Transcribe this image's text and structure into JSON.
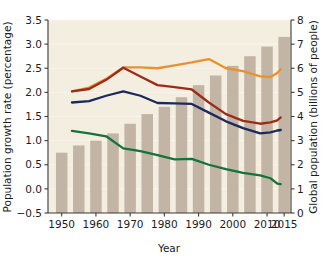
{
  "chart_data": {
    "type": "bar",
    "title": "",
    "xlabel": "Year",
    "ylabel": "Population growth rate (percentage)",
    "y2label": "Global population (billions of people)",
    "xlim": [
      1946,
      2017
    ],
    "ylim": [
      -0.5,
      3.5
    ],
    "y2lim": [
      0,
      8
    ],
    "grid": true,
    "legend": "none",
    "background_color": "#f4eee1",
    "bar_color": "#c3b5a5",
    "xticks": [
      1950,
      1960,
      1970,
      1980,
      1990,
      2000,
      2010,
      2015
    ],
    "yticks": [
      -0.5,
      0.0,
      0.5,
      1.0,
      1.5,
      2.0,
      2.5,
      3.0,
      3.5
    ],
    "ytick_labels": [
      "−0.5",
      "0.0",
      "0.5",
      "1.0",
      "1.5",
      "2.0",
      "2.5",
      "3.0",
      "3.5"
    ],
    "y2ticks": [
      0,
      1,
      2,
      3,
      4,
      5,
      6,
      7,
      8
    ],
    "bars": {
      "name": "Global population",
      "axis": "right",
      "units": "billions of people",
      "x": [
        1950,
        1955,
        1960,
        1965,
        1970,
        1975,
        1980,
        1985,
        1990,
        1995,
        2000,
        2005,
        2010,
        2015
      ],
      "values": [
        2.5,
        2.8,
        3.0,
        3.3,
        3.7,
        4.1,
        4.4,
        4.8,
        5.3,
        5.7,
        6.1,
        6.5,
        6.9,
        7.3
      ]
    },
    "series": [
      {
        "name": "Orange line",
        "color": "#e8912f",
        "axis": "left",
        "x": [
          1953,
          1958,
          1963,
          1968,
          1973,
          1978,
          1983,
          1988,
          1993,
          1998,
          2003,
          2008,
          2011,
          2013,
          2014
        ],
        "values": [
          2.02,
          2.1,
          2.28,
          2.52,
          2.52,
          2.5,
          2.56,
          2.62,
          2.69,
          2.5,
          2.44,
          2.33,
          2.32,
          2.4,
          2.48
        ]
      },
      {
        "name": "Dark red line",
        "color": "#9e2b17",
        "axis": "left",
        "x": [
          1953,
          1958,
          1963,
          1968,
          1973,
          1978,
          1983,
          1988,
          1993,
          1998,
          2003,
          2008,
          2011,
          2013,
          2014
        ],
        "values": [
          2.02,
          2.07,
          2.26,
          2.51,
          2.33,
          2.15,
          2.11,
          2.06,
          1.79,
          1.55,
          1.41,
          1.35,
          1.38,
          1.42,
          1.48
        ]
      },
      {
        "name": "Navy line",
        "color": "#1b2a5e",
        "axis": "left",
        "x": [
          1953,
          1958,
          1963,
          1968,
          1973,
          1978,
          1983,
          1988,
          1993,
          1998,
          2003,
          2008,
          2011,
          2013,
          2014
        ],
        "values": [
          1.79,
          1.82,
          1.93,
          2.02,
          1.93,
          1.78,
          1.77,
          1.76,
          1.58,
          1.4,
          1.26,
          1.15,
          1.17,
          1.21,
          1.22
        ]
      },
      {
        "name": "Green line",
        "color": "#15733a",
        "axis": "left",
        "x": [
          1953,
          1958,
          1963,
          1968,
          1973,
          1978,
          1983,
          1988,
          1993,
          1998,
          2003,
          2008,
          2011,
          2013,
          2014
        ],
        "values": [
          1.2,
          1.15,
          1.09,
          0.84,
          0.78,
          0.7,
          0.61,
          0.62,
          0.5,
          0.41,
          0.33,
          0.28,
          0.22,
          0.11,
          0.1
        ]
      }
    ]
  }
}
